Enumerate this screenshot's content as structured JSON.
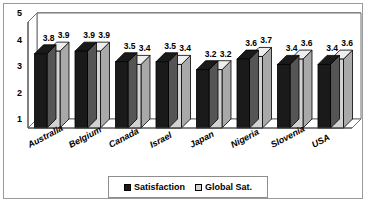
{
  "chart_data": {
    "type": "bar",
    "title": "",
    "subtitle": "",
    "xlabel": "",
    "ylabel": "",
    "categories": [
      "Australia",
      "Belgium",
      "Canada",
      "Israel",
      "Japan",
      "Nigeria",
      "Slovenia",
      "USA"
    ],
    "series": [
      {
        "name": "Satisfaction",
        "color": "#1a1a1a",
        "values": [
          3.8,
          3.9,
          3.5,
          3.5,
          3.2,
          3.6,
          3.4,
          3.4
        ]
      },
      {
        "name": "Global Sat.",
        "color": "#d2d2d2",
        "values": [
          3.9,
          3.9,
          3.4,
          3.4,
          3.2,
          3.7,
          3.6,
          3.6
        ]
      }
    ],
    "ylim": [
      1,
      5
    ],
    "yticks": [
      "1",
      "2",
      "3",
      "4",
      "5"
    ],
    "grid": true,
    "legend_position": "bottom",
    "style": "3d-clustered-column",
    "data_labels": true
  },
  "legend": {
    "items": [
      {
        "label": "Satisfaction",
        "swatch": "dark"
      },
      {
        "label": "Global Sat.",
        "swatch": "light"
      }
    ]
  },
  "colors": {
    "series_dark": "#1a1a1a",
    "series_light": "#d2d2d2",
    "frame": "#9a9a9a",
    "gridline": "#4a4a4a",
    "background": "#ffffff"
  }
}
